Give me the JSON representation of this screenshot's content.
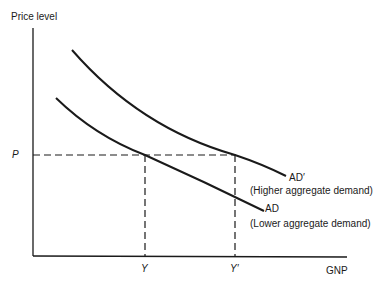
{
  "diagram": {
    "type": "aggregate-demand-shift",
    "y_axis_label": "Price level",
    "x_axis_label": "GNP",
    "price_marker": "P",
    "x_markers": {
      "y": "Y",
      "y_prime": "Y′"
    },
    "curves": [
      {
        "id": "ad_prime",
        "label": "AD′",
        "description": "(Higher aggregate demand)"
      },
      {
        "id": "ad",
        "label": "AD",
        "description": "(Lower aggregate demand)"
      }
    ],
    "colors": {
      "line": "#1a1a1a",
      "background": "#ffffff"
    }
  }
}
